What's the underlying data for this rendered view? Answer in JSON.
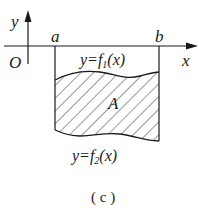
{
  "figure": {
    "axis_x_label": "x",
    "axis_y_label": "y",
    "origin_label": "O",
    "point_a_label": "a",
    "point_b_label": "b",
    "upper_curve": {
      "prefix": "y=f",
      "subscript": "1",
      "suffix": "(x)"
    },
    "lower_curve": {
      "prefix": "y=f",
      "subscript": "2",
      "suffix": "(x)"
    },
    "region_label": "A",
    "caption": "( c )",
    "colors": {
      "stroke": "#1a1a1a",
      "background": "#ffffff"
    }
  }
}
